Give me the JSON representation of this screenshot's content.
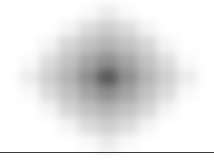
{
  "figure": {
    "title": "",
    "background_color": "#ffffff"
  },
  "axis_rule": {
    "name": "bottom-axis-rule",
    "color": "#3c3c3c",
    "y": 152,
    "thickness": 1
  },
  "chart_data": {
    "type": "heatmap",
    "title": "",
    "subtitle": "",
    "xlabel": "",
    "ylabel": "",
    "grid": false,
    "legend": null,
    "colormap": "grayscale",
    "colormap_min_color": "#ffffff",
    "colormap_max_color": "#5a5a5a",
    "smoothing": "gaussian-blur",
    "interpolation": "blurred-nearest",
    "rows": 9,
    "cols": 9,
    "cell_width": 19.6,
    "cell_height": 16.2,
    "origin_x": 20,
    "origin_y": 5,
    "x": [
      -4,
      -3,
      -2,
      -1,
      0,
      1,
      2,
      3,
      4
    ],
    "y": [
      -4,
      -3,
      -2,
      -1,
      0,
      1,
      2,
      3,
      4
    ],
    "xticklabels": [],
    "yticklabels": [],
    "zlim": [
      0,
      8
    ],
    "values": [
      [
        0,
        0,
        0,
        0,
        1,
        0,
        0,
        0,
        0
      ],
      [
        0,
        0,
        0,
        2,
        3,
        2,
        0,
        0,
        0
      ],
      [
        0,
        0,
        2,
        3,
        4,
        3,
        2,
        0,
        0
      ],
      [
        0,
        2,
        3,
        4,
        5,
        4,
        3,
        2,
        0
      ],
      [
        1,
        3,
        4,
        5,
        6,
        5,
        4,
        3,
        1
      ],
      [
        0,
        2,
        3,
        4,
        5,
        4,
        3,
        2,
        0
      ],
      [
        0,
        0,
        2,
        3,
        4,
        3,
        2,
        0,
        0
      ],
      [
        0,
        0,
        0,
        2,
        3,
        2,
        0,
        0,
        0
      ],
      [
        0,
        0,
        0,
        0,
        1,
        0,
        0,
        0,
        0
      ]
    ],
    "cell_colors": [
      [
        "#ffffff",
        "#ffffff",
        "#ffffff",
        "#fafafa",
        "#ececec",
        "#fafafa",
        "#ffffff",
        "#ffffff",
        "#ffffff"
      ],
      [
        "#ffffff",
        "#ffffff",
        "#f4f4f4",
        "#dcdcdc",
        "#cfcfcf",
        "#dcdcdc",
        "#f4f4f4",
        "#ffffff",
        "#ffffff"
      ],
      [
        "#ffffff",
        "#f4f4f4",
        "#d6d6d6",
        "#c2c2c2",
        "#b4b4b4",
        "#c2c2c2",
        "#d6d6d6",
        "#f4f4f4",
        "#ffffff"
      ],
      [
        "#fafafa",
        "#dcdcdc",
        "#c2c2c2",
        "#a5a5a5",
        "#8e8e8e",
        "#a5a5a5",
        "#c2c2c2",
        "#dcdcdc",
        "#fafafa"
      ],
      [
        "#ececec",
        "#cfcfcf",
        "#b4b4b4",
        "#8e8e8e",
        "#5a5a5a",
        "#8e8e8e",
        "#b4b4b4",
        "#cfcfcf",
        "#ececec"
      ],
      [
        "#fafafa",
        "#dcdcdc",
        "#c2c2c2",
        "#a5a5a5",
        "#8e8e8e",
        "#a5a5a5",
        "#c2c2c2",
        "#dcdcdc",
        "#fafafa"
      ],
      [
        "#ffffff",
        "#f4f4f4",
        "#d6d6d6",
        "#c2c2c2",
        "#b4b4b4",
        "#c2c2c2",
        "#d6d6d6",
        "#f4f4f4",
        "#ffffff"
      ],
      [
        "#ffffff",
        "#ffffff",
        "#f4f4f4",
        "#dcdcdc",
        "#cfcfcf",
        "#dcdcdc",
        "#f4f4f4",
        "#ffffff",
        "#ffffff"
      ],
      [
        "#ffffff",
        "#ffffff",
        "#ffffff",
        "#fafafa",
        "#ececec",
        "#fafafa",
        "#ffffff",
        "#ffffff",
        "#ffffff"
      ]
    ]
  }
}
